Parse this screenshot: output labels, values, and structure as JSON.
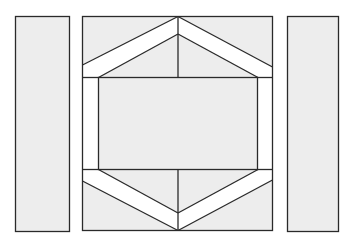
{
  "diagram": {
    "colors": {
      "background": "#ffffff",
      "fill": "#ededed",
      "band": "#ffffff",
      "stroke": "#2a2a2a"
    },
    "shapes": {
      "left_panel": {
        "x": 15,
        "y": 16,
        "w": 55,
        "h": 216
      },
      "right_panel": {
        "x": 287,
        "y": 16,
        "w": 52,
        "h": 216
      },
      "center_block": {
        "x": 82,
        "y": 16,
        "w": 191,
        "h": 215
      },
      "inner_rect": {
        "x": 98,
        "y": 77,
        "w": 160,
        "h": 93
      }
    }
  }
}
